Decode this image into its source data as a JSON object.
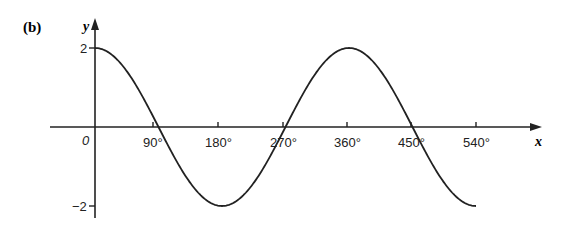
{
  "part_label": "(b)",
  "chart_data": {
    "type": "line",
    "title": "",
    "function": "y = 2cos(x)",
    "xlabel": "x",
    "ylabel": "y",
    "origin_label": "0",
    "x_ticks": [
      "90°",
      "180°",
      "270°",
      "360°",
      "450°",
      "540°"
    ],
    "x_tick_values": [
      90,
      180,
      270,
      360,
      450,
      540
    ],
    "y_ticks": [
      "2",
      "−2"
    ],
    "y_tick_values": [
      2,
      -2
    ],
    "xlim": [
      0,
      540
    ],
    "ylim": [
      -2,
      2
    ],
    "grid": false,
    "series": [
      {
        "name": "y = 2cos x",
        "x": [
          0,
          45,
          90,
          135,
          180,
          225,
          270,
          315,
          360,
          405,
          450,
          495,
          540
        ],
        "y": [
          2,
          1.41,
          0,
          -1.41,
          -2,
          -1.41,
          0,
          1.41,
          2,
          1.41,
          0,
          -1.41,
          -2
        ]
      }
    ]
  }
}
